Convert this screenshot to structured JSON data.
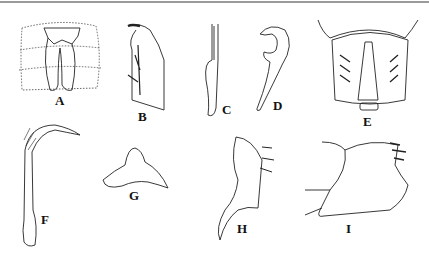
{
  "figure": {
    "panels": [
      {
        "id": "A",
        "label": "A"
      },
      {
        "id": "B",
        "label": "B"
      },
      {
        "id": "C",
        "label": "C"
      },
      {
        "id": "D",
        "label": "D"
      },
      {
        "id": "E",
        "label": "E"
      },
      {
        "id": "F",
        "label": "F"
      },
      {
        "id": "G",
        "label": "G"
      },
      {
        "id": "H",
        "label": "H"
      },
      {
        "id": "I",
        "label": "I"
      }
    ],
    "colors": {
      "ink": "#222222",
      "rule": "#9a9a9a",
      "background": "#ffffff"
    }
  }
}
